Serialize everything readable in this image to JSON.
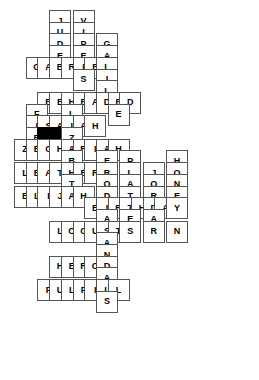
{
  "puzzle": {
    "title": "Crossword Puzzle Grid",
    "grid": {
      "cell_size": 22,
      "cell_pitch": 23.4,
      "origin_x": 14,
      "origin_y": 10,
      "columns": 11,
      "rows": 16
    },
    "colors": {
      "background": "#ffffff",
      "cell_fill": "#ffffff",
      "cell_border": "#555555",
      "block_fill": "#000000",
      "letter": "#000000"
    },
    "across_words": [
      {
        "answer": "GABRIEL",
        "row": 5,
        "col": 2
      },
      {
        "answer": "BEHEADED",
        "row": 7,
        "col": 2
      },
      {
        "answer": "ISAIAH",
        "row": 9,
        "col": 1
      },
      {
        "answer": "ZECHARIAH",
        "row": 11,
        "col": 0
      },
      {
        "answer": "LEATHER",
        "row": 13,
        "col": 0
      },
      {
        "answer": "ELIJAH",
        "row": 15,
        "col": 0
      },
      {
        "answer": "BIRTHDAY",
        "row": 17,
        "col": 5
      },
      {
        "answer": "LOCUSTS",
        "row": 19,
        "col": 1
      },
      {
        "answer": "HEROD",
        "row": 23,
        "col": 1
      },
      {
        "answer": "FULFILL",
        "row": 27,
        "col": 0
      }
    ],
    "down_words": [
      {
        "answer": "JUDEA",
        "row": 0,
        "col": 3
      },
      {
        "answer": "VIPERS",
        "row": 0,
        "col": 5
      },
      {
        "answer": "GALILEE",
        "row": 2,
        "col": 8
      },
      {
        "answer": "FIR",
        "row": 8,
        "col": 1
      },
      {
        "answer": "ELIZABETH",
        "row": 6,
        "col": 4
      },
      {
        "answer": "HERODIAS",
        "row": 12,
        "col": 7
      },
      {
        "answer": "PLATTER",
        "row": 12,
        "col": 9
      },
      {
        "answer": "JORDAN",
        "row": 13,
        "col": 11
      },
      {
        "answer": "HONEY",
        "row": 12,
        "col": 13
      },
      {
        "answer": "SANDALS",
        "row": 19,
        "col": 5
      }
    ],
    "cells": [
      {
        "r": 0,
        "c": 3,
        "ch": "J"
      },
      {
        "r": 0,
        "c": 5,
        "ch": "V"
      },
      {
        "r": 1,
        "c": 3,
        "ch": "U"
      },
      {
        "r": 1,
        "c": 5,
        "ch": "I"
      },
      {
        "r": 2,
        "c": 3,
        "ch": "D"
      },
      {
        "r": 2,
        "c": 5,
        "ch": "P"
      },
      {
        "r": 2,
        "c": 7,
        "ch": "G"
      },
      {
        "r": 3,
        "c": 3,
        "ch": "E"
      },
      {
        "r": 3,
        "c": 5,
        "ch": "E"
      },
      {
        "r": 3,
        "c": 7,
        "ch": "A"
      },
      {
        "r": 4,
        "c": 1,
        "ch": "G"
      },
      {
        "r": 4,
        "c": 2,
        "ch": "A"
      },
      {
        "r": 4,
        "c": 3,
        "ch": "B"
      },
      {
        "r": 4,
        "c": 4,
        "ch": "R"
      },
      {
        "r": 4,
        "c": 5,
        "ch": "I"
      },
      {
        "r": 4,
        "c": 6,
        "ch": "E"
      },
      {
        "r": 4,
        "c": 7,
        "ch": "L"
      },
      {
        "r": 5,
        "c": 5,
        "ch": "S"
      },
      {
        "r": 5,
        "c": 7,
        "ch": "I"
      },
      {
        "r": 6,
        "c": 7,
        "ch": "L"
      },
      {
        "r": 7,
        "c": 2,
        "ch": "B"
      },
      {
        "r": 7,
        "c": 3,
        "ch": "E"
      },
      {
        "r": 7,
        "c": 4,
        "ch": "H"
      },
      {
        "r": 7,
        "c": 5,
        "ch": "E"
      },
      {
        "r": 7,
        "c": 6,
        "ch": "A"
      },
      {
        "r": 7,
        "c": 7,
        "ch": "D"
      },
      {
        "r": 7,
        "c": 8,
        "ch": "E"
      },
      {
        "r": 7,
        "c": 9,
        "ch": "D"
      },
      {
        "r": 8,
        "c": 1,
        "ch": "F"
      },
      {
        "r": 8,
        "c": 4,
        "ch": "L"
      },
      {
        "r": 8,
        "c": 8,
        "ch": "E"
      },
      {
        "r": 9,
        "c": 1,
        "ch": "I"
      },
      {
        "r": 9,
        "c": 2,
        "ch": "S"
      },
      {
        "r": 9,
        "c": 3,
        "ch": "A"
      },
      {
        "r": 9,
        "c": 4,
        "ch": "I"
      },
      {
        "r": 9,
        "c": 5,
        "ch": "A"
      },
      {
        "r": 9,
        "c": 6,
        "ch": "H"
      },
      {
        "r": 10,
        "c": 1,
        "ch": "R"
      },
      {
        "r": 10,
        "c": 2,
        "ch": "",
        "block": true
      },
      {
        "r": 10,
        "c": 3,
        "ch": "",
        "block": true
      },
      {
        "r": 10,
        "c": 4,
        "ch": "Z"
      },
      {
        "r": 11,
        "c": 0,
        "ch": "Z"
      },
      {
        "r": 11,
        "c": 1,
        "ch": "E"
      },
      {
        "r": 11,
        "c": 2,
        "ch": "C"
      },
      {
        "r": 11,
        "c": 3,
        "ch": "H"
      },
      {
        "r": 11,
        "c": 4,
        "ch": "A"
      },
      {
        "r": 11,
        "c": 5,
        "ch": "R"
      },
      {
        "r": 11,
        "c": 6,
        "ch": "I"
      },
      {
        "r": 11,
        "c": 7,
        "ch": "A"
      },
      {
        "r": 11,
        "c": 8,
        "ch": "H"
      },
      {
        "r": 12,
        "c": 4,
        "ch": "B"
      },
      {
        "r": 12,
        "c": 7,
        "ch": "E"
      },
      {
        "r": 12,
        "c": 9,
        "ch": "P"
      },
      {
        "r": 12,
        "c": 13,
        "ch": "H"
      },
      {
        "r": 13,
        "c": 0,
        "ch": "L"
      },
      {
        "r": 13,
        "c": 1,
        "ch": "E"
      },
      {
        "r": 13,
        "c": 2,
        "ch": "A"
      },
      {
        "r": 13,
        "c": 3,
        "ch": "T"
      },
      {
        "r": 13,
        "c": 4,
        "ch": "H"
      },
      {
        "r": 13,
        "c": 5,
        "ch": "E"
      },
      {
        "r": 13,
        "c": 6,
        "ch": "R"
      },
      {
        "r": 13,
        "c": 7,
        "ch": "R"
      },
      {
        "r": 13,
        "c": 9,
        "ch": "L"
      },
      {
        "r": 13,
        "c": 11,
        "ch": "J"
      },
      {
        "r": 13,
        "c": 13,
        "ch": "O"
      },
      {
        "r": 14,
        "c": 4,
        "ch": "T"
      },
      {
        "r": 14,
        "c": 7,
        "ch": "O"
      },
      {
        "r": 14,
        "c": 9,
        "ch": "A"
      },
      {
        "r": 14,
        "c": 11,
        "ch": "O"
      },
      {
        "r": 14,
        "c": 13,
        "ch": "N"
      },
      {
        "r": 15,
        "c": 0,
        "ch": "E"
      },
      {
        "r": 15,
        "c": 1,
        "ch": "L"
      },
      {
        "r": 15,
        "c": 2,
        "ch": "I"
      },
      {
        "r": 15,
        "c": 3,
        "ch": "J"
      },
      {
        "r": 15,
        "c": 4,
        "ch": "A"
      },
      {
        "r": 15,
        "c": 5,
        "ch": "H"
      },
      {
        "r": 15,
        "c": 7,
        "ch": "D"
      },
      {
        "r": 15,
        "c": 9,
        "ch": "T"
      },
      {
        "r": 15,
        "c": 11,
        "ch": "R"
      },
      {
        "r": 15,
        "c": 13,
        "ch": "E"
      },
      {
        "r": 16,
        "c": 6,
        "ch": "B"
      },
      {
        "r": 16,
        "c": 7,
        "ch": "I"
      },
      {
        "r": 16,
        "c": 8,
        "ch": "R"
      },
      {
        "r": 16,
        "c": 9,
        "ch": "T"
      },
      {
        "r": 16,
        "c": 10,
        "ch": "H"
      },
      {
        "r": 16,
        "c": 11,
        "ch": "D"
      },
      {
        "r": 16,
        "c": 12,
        "ch": "A"
      },
      {
        "r": 16,
        "c": 13,
        "ch": "Y"
      },
      {
        "r": 17,
        "c": 7,
        "ch": "A"
      },
      {
        "r": 17,
        "c": 9,
        "ch": "E"
      },
      {
        "r": 17,
        "c": 11,
        "ch": "A"
      },
      {
        "r": 18,
        "c": 3,
        "ch": "L"
      },
      {
        "r": 18,
        "c": 4,
        "ch": "O"
      },
      {
        "r": 18,
        "c": 5,
        "ch": "C"
      },
      {
        "r": 18,
        "c": 6,
        "ch": "U"
      },
      {
        "r": 18,
        "c": 7,
        "ch": "S"
      },
      {
        "r": 18,
        "c": 8,
        "ch": "T"
      },
      {
        "r": 18,
        "c": 9,
        "ch": "S"
      },
      {
        "r": 18,
        "c": 11,
        "ch": "R"
      },
      {
        "r": 18,
        "c": 13,
        "ch": "N"
      },
      {
        "r": 19,
        "c": 7,
        "ch": "A"
      },
      {
        "r": 20,
        "c": 7,
        "ch": "N"
      },
      {
        "r": 21,
        "c": 3,
        "ch": "H"
      },
      {
        "r": 21,
        "c": 4,
        "ch": "E"
      },
      {
        "r": 21,
        "c": 5,
        "ch": "R"
      },
      {
        "r": 21,
        "c": 6,
        "ch": "O"
      },
      {
        "r": 21,
        "c": 7,
        "ch": "D"
      },
      {
        "r": 22,
        "c": 7,
        "ch": "A"
      },
      {
        "r": 23,
        "c": 2,
        "ch": "F"
      },
      {
        "r": 23,
        "c": 3,
        "ch": "U"
      },
      {
        "r": 23,
        "c": 4,
        "ch": "L"
      },
      {
        "r": 23,
        "c": 5,
        "ch": "F"
      },
      {
        "r": 23,
        "c": 6,
        "ch": "I"
      },
      {
        "r": 23,
        "c": 7,
        "ch": "L"
      },
      {
        "r": 23,
        "c": 8,
        "ch": "L"
      },
      {
        "r": 24,
        "c": 7,
        "ch": "S"
      }
    ]
  }
}
